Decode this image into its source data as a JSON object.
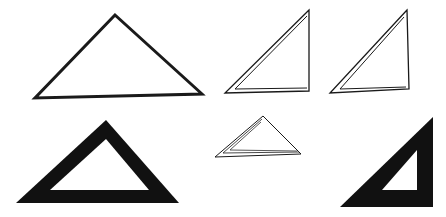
{
  "illustration": {
    "description": "Six triangle drawings illustrating outline, folded/layered, and solid-band triangles",
    "colors": {
      "ink": "#1a1a1a",
      "paper": "#ffffff"
    },
    "shapes": [
      {
        "id": "outline-triangle-large",
        "style": "thick-outline",
        "points": "115,15 35,98 202,94"
      },
      {
        "id": "double-line-right-triangle-1",
        "style": "double-outline",
        "outer": "309,10 225,93 309,91",
        "inner": "307,16 235,89 307,88"
      },
      {
        "id": "double-line-right-triangle-2",
        "style": "double-outline",
        "outer": "407,10 330,93 409,89",
        "inner": "404,17 340,89 406,87"
      },
      {
        "id": "solid-band-triangle-left",
        "style": "solid-band",
        "outer": "106,120 16,203 179,203",
        "inner": "106,139 50,190 149,190"
      },
      {
        "id": "layered-small-triangle",
        "style": "triple-outline",
        "outer": "263,116 215,157 301,154",
        "middle": "262,119 223,153 299,152",
        "inner": "261,122 230,150 297,151"
      },
      {
        "id": "solid-band-right-triangle",
        "style": "solid-band",
        "outer": "433,117 340,207 433,207",
        "inner": "417,150 382,190 417,190"
      }
    ]
  }
}
